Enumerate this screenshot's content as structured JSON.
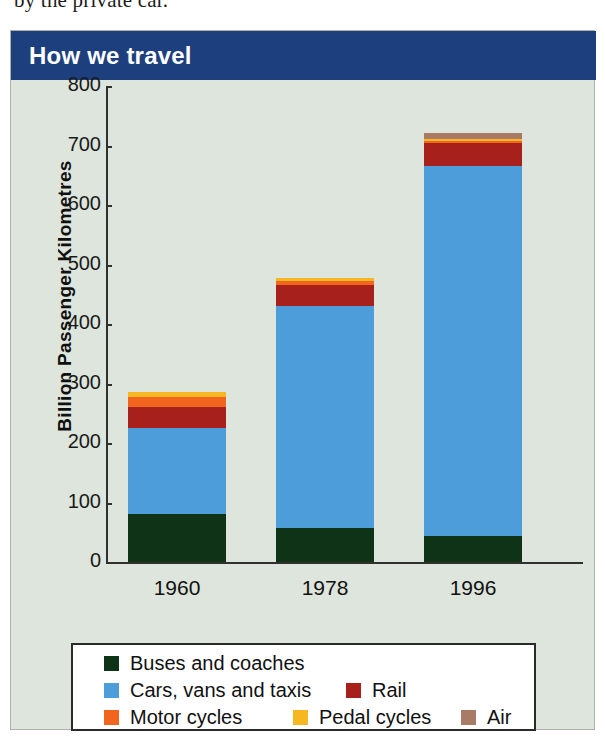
{
  "page": {
    "body_text_snippet": "by the private car."
  },
  "figure": {
    "title": "How we travel"
  },
  "chart_data": {
    "type": "bar",
    "subtype": "stacked-bar",
    "title": "How we travel",
    "xlabel": "",
    "ylabel": "Billion Passenger Kilometres",
    "ylim": [
      0,
      800
    ],
    "yticks": [
      0,
      100,
      200,
      300,
      400,
      500,
      600,
      700,
      800
    ],
    "ytick_labels": [
      "0",
      "100",
      "200",
      "300",
      "400",
      "500",
      "600",
      "700",
      "800"
    ],
    "grid": false,
    "legend_position": "bottom",
    "categories": [
      "1960",
      "1978",
      "1996"
    ],
    "series": [
      {
        "name": "Buses and coaches",
        "color": "#0e3316",
        "values": [
          80,
          58,
          43
        ]
      },
      {
        "name": "Cars, vans and taxis",
        "color": "#4d9ddb",
        "values": [
          145,
          372,
          623
        ]
      },
      {
        "name": "Rail",
        "color": "#a8201c",
        "values": [
          35,
          35,
          38
        ]
      },
      {
        "name": "Motor cycles",
        "color": "#f2651f",
        "values": [
          18,
          8,
          4
        ]
      },
      {
        "name": "Pedal cycles",
        "color": "#f6b822",
        "values": [
          7,
          5,
          3
        ]
      },
      {
        "name": "Air",
        "color": "#a87b66",
        "values": [
          0,
          0,
          10
        ]
      }
    ],
    "totals": [
      285,
      478,
      721
    ]
  },
  "legend": {
    "rows": [
      [
        {
          "label": "Buses and coaches",
          "color": "#0e3316",
          "x": 31
        }
      ],
      [
        {
          "label": "Cars, vans and taxis",
          "color": "#4d9ddb",
          "x": 31
        },
        {
          "label": "Rail",
          "color": "#a8201c",
          "x": 273
        }
      ],
      [
        {
          "label": "Motor cycles",
          "color": "#f2651f",
          "x": 31
        },
        {
          "label": "Pedal cycles",
          "color": "#f6b822",
          "x": 220
        },
        {
          "label": "Air",
          "color": "#a87b66",
          "x": 388
        }
      ]
    ]
  }
}
